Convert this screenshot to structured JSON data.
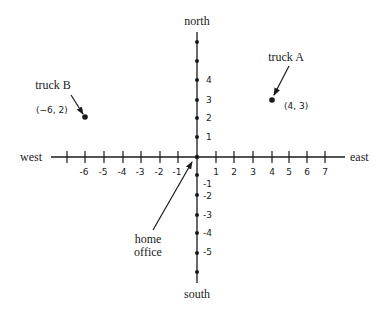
{
  "directions": {
    "north": "north",
    "south": "south",
    "east": "east",
    "west": "west"
  },
  "x_tick_labels": [
    "-6",
    "-5",
    "-4",
    "-3",
    "-2",
    "-1",
    "1",
    "2",
    "3",
    "4",
    "5",
    "6",
    "7"
  ],
  "y_tick_labels": [
    "4",
    "3",
    "2",
    "1",
    "-1",
    "-2",
    "-3",
    "-4",
    "-5"
  ],
  "points": {
    "truck_a": {
      "label": "truck A",
      "coords": "(4, 3)",
      "x": 4,
      "y": 3
    },
    "truck_b": {
      "label": "truck B",
      "coords": "(−6, 2)",
      "x": -6,
      "y": 2
    },
    "home_office": {
      "label_line1": "home",
      "label_line2": "office",
      "x": 0,
      "y": 0
    }
  },
  "colors": {
    "ink": "#1a1a1a",
    "background": "#ffffff"
  }
}
